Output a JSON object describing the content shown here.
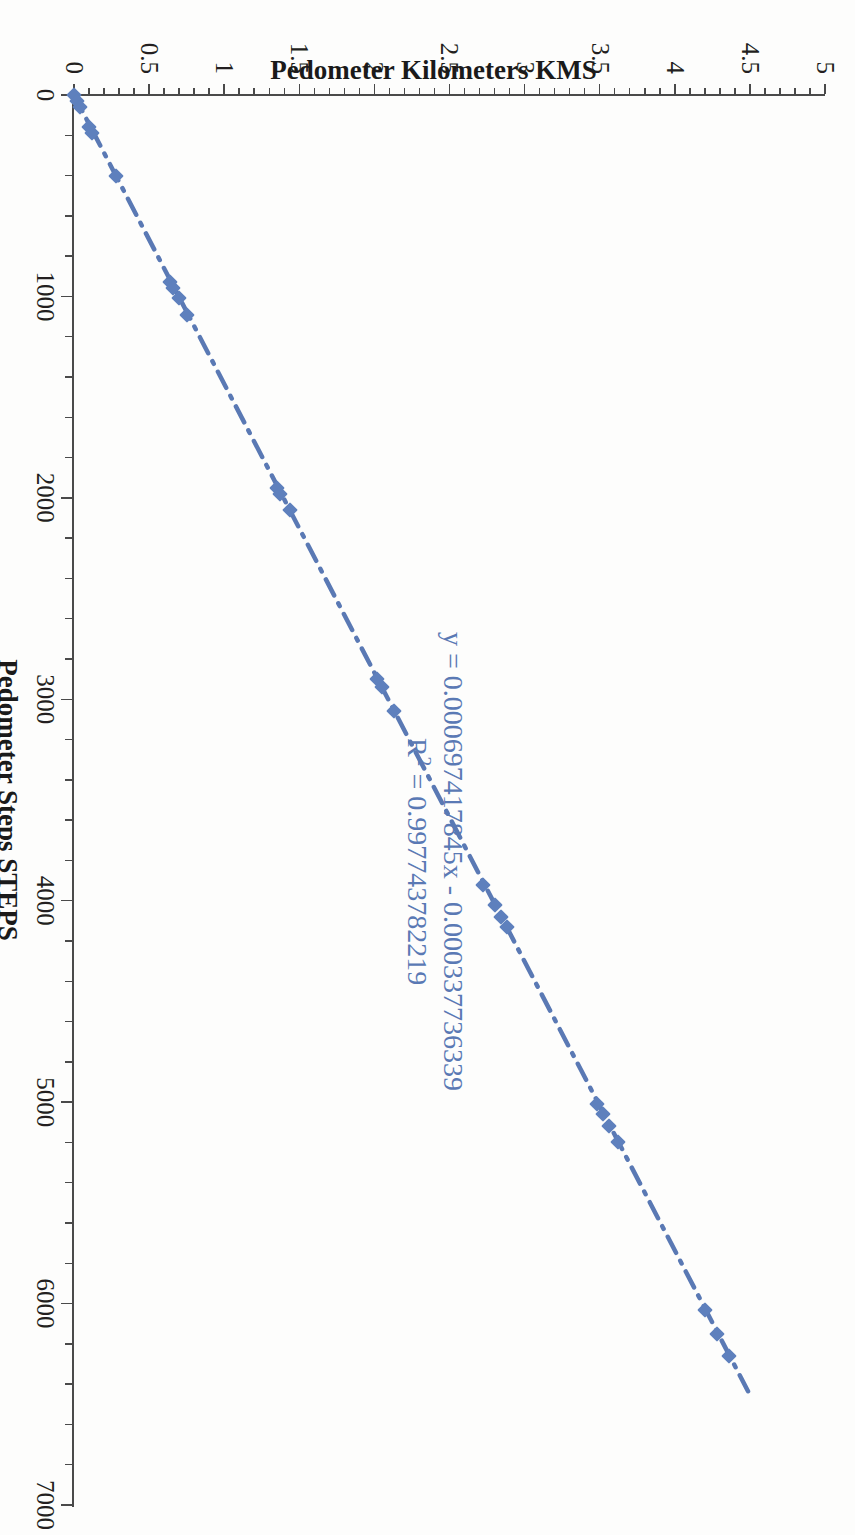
{
  "page": {
    "kind": "scanned-scatter-chart",
    "rotation_degrees": 90,
    "background_color": "#ffffff"
  },
  "chart_data": {
    "type": "scatter",
    "title": "",
    "xlabel": "Pedometer Steps STEPS",
    "ylabel": "Pedometer Kilometers KMS",
    "xlim": [
      0,
      7000
    ],
    "ylim": [
      0,
      5
    ],
    "x_major_step": 1000,
    "x_minor_step": 200,
    "y_major_step": 0.5,
    "y_minor_step": 0.1,
    "grid": false,
    "legend": false,
    "series_color": "#5e80bd",
    "marker": "diamond",
    "xticks": [
      0,
      1000,
      2000,
      3000,
      4000,
      5000,
      6000,
      7000
    ],
    "xtick_labels": [
      "0",
      "1000",
      "2000",
      "3000",
      "4000",
      "5000",
      "6000",
      "7000"
    ],
    "yticks": [
      0,
      0.5,
      1,
      1.5,
      2,
      2.5,
      3,
      3.5,
      4,
      4.5,
      5
    ],
    "ytick_labels": [
      "0",
      "0.5",
      "1",
      "1.5",
      "2",
      "2.5",
      "3",
      "3.5",
      "4",
      "4.5",
      "5"
    ],
    "x": [
      0,
      30,
      60,
      160,
      190,
      400,
      930,
      960,
      1010,
      1090,
      1950,
      1980,
      2060,
      2900,
      2940,
      3060,
      3920,
      4020,
      4080,
      4130,
      5010,
      5060,
      5120,
      5200,
      6030,
      6150,
      6260
    ],
    "y": [
      0.0,
      0.02,
      0.04,
      0.1,
      0.12,
      0.28,
      0.64,
      0.66,
      0.7,
      0.75,
      1.35,
      1.37,
      1.44,
      2.02,
      2.05,
      2.13,
      2.72,
      2.8,
      2.84,
      2.88,
      3.48,
      3.52,
      3.56,
      3.62,
      4.2,
      4.28,
      4.36
    ],
    "trendline": {
      "type": "linear",
      "slope": 0.000697417845,
      "intercept": -0.000337736339,
      "r_squared": 0.997743782219,
      "equation_label": "y = 0.000697417845x - 0.000337736339",
      "r2_prefix": "R",
      "r2_sup": "2",
      "r2_label": " = 0.997743782219",
      "style": "dash-dot",
      "color": "#5a79b4"
    }
  }
}
